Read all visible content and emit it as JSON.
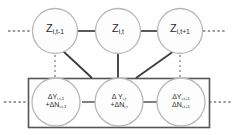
{
  "diagram": {
    "type": "graphical-model",
    "colors": {
      "node_stroke": "#b8b8b8",
      "node_fill": "#fdfdfd",
      "edge": "#3c3c3c",
      "plate_stroke": "#555555",
      "dotted": "#9a9a9a",
      "text": "#2a2a2a"
    },
    "latent_row": {
      "label": "Z-layer",
      "nodes": [
        {
          "id": "z-prev",
          "name": "node-z-t-minus-1",
          "text": "Z",
          "subscript": "i,t-1"
        },
        {
          "id": "z-curr",
          "name": "node-z-t",
          "text": "Z",
          "subscript": "i,t"
        },
        {
          "id": "z-next",
          "name": "node-z-t-plus-1",
          "text": "Z",
          "subscript": "i,t+1"
        }
      ],
      "left_ellipsis": "······",
      "right_ellipsis": "······"
    },
    "observed_row": {
      "label": "Delta-Y plate",
      "nodes": [
        {
          "id": "dy-prev",
          "name": "node-dy-t-minus-1",
          "line1_text": "ΔY",
          "line1_sub": "i,t-1",
          "line2_text": "+ΔN",
          "line2_sub": "i,t-1"
        },
        {
          "id": "dy-curr",
          "name": "node-dy-t",
          "line1_text": "Δ Y",
          "line1_sub": "i,t",
          "line2_text": "+ΔN",
          "line2_sub": "i,t"
        },
        {
          "id": "dy-next",
          "name": "node-dy-t-plus-1",
          "line1_text": "ΔY",
          "line1_sub": "i,t+1",
          "line2_text": "ΔN",
          "line2_sub": "i,t+1"
        }
      ],
      "left_ellipsis": "·····",
      "right_ellipsis": "·····"
    },
    "edges": [
      {
        "name": "edge-z-prev-to-z-curr",
        "kind": "solid-horizontal"
      },
      {
        "name": "edge-z-curr-to-z-next",
        "kind": "solid-horizontal"
      },
      {
        "name": "edge-dy-prev-to-dy-curr",
        "kind": "solid-horizontal"
      },
      {
        "name": "edge-dy-curr-to-dy-next",
        "kind": "solid-horizontal"
      },
      {
        "name": "edge-z-prev-to-dy-curr",
        "kind": "solid-diagonal"
      },
      {
        "name": "edge-z-curr-to-dy-curr",
        "kind": "solid-vertical"
      },
      {
        "name": "edge-z-next-to-dy-curr",
        "kind": "solid-diagonal"
      },
      {
        "name": "edge-z-prev-vertical-dotted",
        "kind": "dotted-vertical"
      },
      {
        "name": "edge-z-curr-vertical-dotted",
        "kind": "dotted-vertical"
      },
      {
        "name": "edge-z-next-vertical-dotted",
        "kind": "dotted-vertical"
      }
    ],
    "plate": {
      "name": "plate-rectangle",
      "label": ""
    }
  }
}
